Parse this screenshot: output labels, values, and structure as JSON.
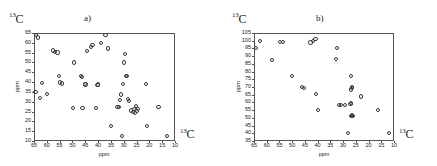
{
  "figure": {
    "background": "#ffffff",
    "marker_color": "#3a3a3a",
    "axis_color": "#555555"
  },
  "panels": [
    {
      "id": "a",
      "letter": "a)",
      "corner_nucleus_sup": "13",
      "corner_nucleus_el": "C",
      "axis_nucleus_sup": "13",
      "axis_nucleus_el": "C",
      "chart_data": {
        "type": "scatter",
        "title": "a)",
        "xlabel": "ppm",
        "ylabel": "ppm",
        "xlim": [
          65,
          10
        ],
        "ylim": [
          65,
          10
        ],
        "x_ticks": [
          65,
          60,
          55,
          50,
          45,
          40,
          35,
          30,
          25,
          20,
          15,
          10
        ],
        "y_ticks": [
          10,
          15,
          20,
          25,
          30,
          35,
          40,
          45,
          50,
          55,
          60,
          65
        ],
        "x_axis_reversed": true,
        "y_axis_reversed": true,
        "grid": false,
        "legend": null,
        "points": [
          [
            64.6,
            64.6
          ],
          [
            63.8,
            63.2
          ],
          [
            62.3,
            40.2
          ],
          [
            60.4,
            34.3
          ],
          [
            58.0,
            56.6
          ],
          [
            57.2,
            56.0
          ],
          [
            56.2,
            55.6
          ],
          [
            55.6,
            43.5
          ],
          [
            55.1,
            40.3
          ],
          [
            54.6,
            39.8
          ],
          [
            63.2,
            32.5
          ],
          [
            64.8,
            35.4
          ],
          [
            50.2,
            27.5
          ],
          [
            49.8,
            50.5
          ],
          [
            46.9,
            43.5
          ],
          [
            46.8,
            43.2
          ],
          [
            46.5,
            27.3
          ],
          [
            45.6,
            39.6
          ],
          [
            45.3,
            39.3
          ],
          [
            44.8,
            56.2
          ],
          [
            43.3,
            58.2
          ],
          [
            42.6,
            59.6
          ],
          [
            41.3,
            27.3
          ],
          [
            40.6,
            39.0
          ],
          [
            40.4,
            39.3
          ],
          [
            39.2,
            60.6
          ],
          [
            37.5,
            64.6
          ],
          [
            36.4,
            57.6
          ],
          [
            35.3,
            18.0
          ],
          [
            32.8,
            27.8
          ],
          [
            32.3,
            28.0
          ],
          [
            31.9,
            31.5
          ],
          [
            31.4,
            34.2
          ],
          [
            31.0,
            13.0
          ],
          [
            30.7,
            39.5
          ],
          [
            30.4,
            50.5
          ],
          [
            30.0,
            55.0
          ],
          [
            29.4,
            43.5
          ],
          [
            29.1,
            43.8
          ],
          [
            28.6,
            32.0
          ],
          [
            28.2,
            30.8
          ],
          [
            27.6,
            26.0
          ],
          [
            26.8,
            25.2
          ],
          [
            26.3,
            26.6
          ],
          [
            25.9,
            24.6
          ],
          [
            25.6,
            28.2
          ],
          [
            25.2,
            25.8
          ],
          [
            24.8,
            27.0
          ],
          [
            21.8,
            39.6
          ],
          [
            21.3,
            18.0
          ],
          [
            16.8,
            28.0
          ],
          [
            13.4,
            13.0
          ]
        ]
      }
    },
    {
      "id": "b",
      "letter": "b)",
      "corner_nucleus_sup": "13",
      "corner_nucleus_el": "C",
      "axis_nucleus_sup": "13",
      "axis_nucleus_el": "C",
      "chart_data": {
        "type": "scatter",
        "title": "b)",
        "xlabel": "ppm",
        "ylabel": "ppm",
        "xlim": [
          65,
          10
        ],
        "ylim": [
          105,
          35
        ],
        "x_ticks": [
          65,
          60,
          55,
          50,
          45,
          40,
          35,
          30,
          25,
          20,
          15,
          10
        ],
        "y_ticks": [
          35,
          40,
          45,
          50,
          55,
          60,
          65,
          70,
          75,
          80,
          85,
          90,
          95,
          100,
          105
        ],
        "x_axis_reversed": true,
        "y_axis_reversed": true,
        "grid": false,
        "legend": null,
        "points": [
          [
            64.5,
            96.0
          ],
          [
            63.0,
            100.5
          ],
          [
            58.3,
            88.0
          ],
          [
            55.3,
            99.6
          ],
          [
            53.9,
            99.6
          ],
          [
            50.4,
            78.0
          ],
          [
            46.6,
            70.5
          ],
          [
            45.9,
            70.2
          ],
          [
            43.2,
            99.5
          ],
          [
            42.2,
            100.3
          ],
          [
            41.2,
            101.5
          ],
          [
            41.0,
            66.0
          ],
          [
            40.4,
            56.0
          ],
          [
            33.3,
            89.0
          ],
          [
            32.8,
            96.0
          ],
          [
            31.9,
            59.0
          ],
          [
            31.3,
            58.8
          ],
          [
            28.4,
            41.0
          ],
          [
            27.4,
            52.0
          ],
          [
            27.0,
            52.2
          ],
          [
            26.5,
            51.8
          ],
          [
            27.5,
            59.5
          ],
          [
            27.4,
            60.5
          ],
          [
            27.3,
            69.0
          ],
          [
            27.0,
            69.8
          ],
          [
            26.9,
            70.8
          ],
          [
            27.2,
            78.0
          ],
          [
            29.5,
            59.0
          ],
          [
            23.4,
            64.5
          ],
          [
            16.8,
            56.0
          ],
          [
            12.2,
            41.0
          ]
        ]
      }
    }
  ]
}
